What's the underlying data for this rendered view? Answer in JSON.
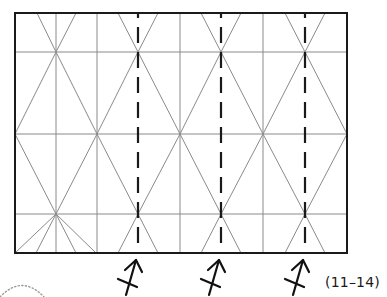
{
  "figure": {
    "type": "origami crease pattern",
    "step_label": "(11–14)",
    "colors": {
      "border": "#1a1a1a",
      "crease": "#8a8a8a",
      "valley_fold": "#1a1a1a",
      "dotted_arc": "#9a9a9a"
    },
    "frame": {
      "left": 15,
      "top": 13,
      "right": 347,
      "bottom": 253
    },
    "horizontal_creases_y": [
      52,
      134,
      214
    ],
    "solid_vertical_creases_x": [
      56,
      97,
      180,
      263
    ],
    "valley_fold_lines_x": [
      138,
      221,
      305
    ],
    "valley_fold_arrow_count": 3
  }
}
